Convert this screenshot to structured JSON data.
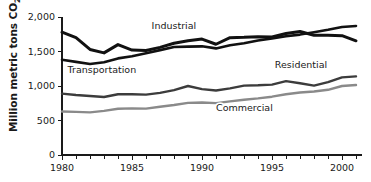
{
  "chart_data": {
    "type": "line",
    "title": "",
    "xlabel": "",
    "ylabel": "Million metric tons CO2",
    "ylabel_main": "Million metric tons CO",
    "ylabel_sub": "2",
    "xlim": [
      1980,
      2001
    ],
    "ylim": [
      0,
      2000
    ],
    "grid": false,
    "legend_position": "inline-annotations",
    "ytick_labels": [
      "2,000",
      "1,500",
      "1,000",
      "500",
      "0"
    ],
    "ytick_values": [
      2000,
      1500,
      1000,
      500,
      0
    ],
    "xtick_labels": [
      "1980",
      "1985",
      "1990",
      "1995",
      "2000"
    ],
    "xtick_values": [
      1980,
      1985,
      1990,
      1995,
      2000
    ],
    "x": [
      1980,
      1981,
      1982,
      1983,
      1984,
      1985,
      1986,
      1987,
      1988,
      1989,
      1990,
      1991,
      1992,
      1993,
      1994,
      1995,
      1996,
      1997,
      1998,
      1999,
      2000,
      2001
    ],
    "series": [
      {
        "name": "Industrial",
        "color": "#111111",
        "width": 3.0,
        "label_x": 1986.4,
        "label_y": 1830,
        "values": [
          1780,
          1700,
          1530,
          1480,
          1600,
          1520,
          1515,
          1560,
          1620,
          1655,
          1680,
          1605,
          1700,
          1705,
          1715,
          1710,
          1760,
          1790,
          1735,
          1735,
          1730,
          1655
        ]
      },
      {
        "name": "Transportation",
        "color": "#111111",
        "width": 2.6,
        "label_x": 1980.4,
        "label_y": 1195,
        "values": [
          1380,
          1350,
          1320,
          1345,
          1400,
          1430,
          1475,
          1520,
          1565,
          1570,
          1575,
          1545,
          1590,
          1620,
          1660,
          1690,
          1720,
          1745,
          1780,
          1815,
          1855,
          1870
        ]
      },
      {
        "name": "Residential",
        "color": "#3c3c3c",
        "width": 2.4,
        "label_x": 1995.2,
        "label_y": 1255,
        "values": [
          890,
          870,
          855,
          840,
          880,
          880,
          875,
          900,
          940,
          1000,
          955,
          935,
          965,
          1005,
          1010,
          1020,
          1070,
          1040,
          1005,
          1055,
          1125,
          1140
        ]
      },
      {
        "name": "Commercial",
        "color": "#8a8a8a",
        "width": 2.4,
        "label_x": 1991.0,
        "label_y": 640,
        "values": [
          630,
          625,
          618,
          640,
          670,
          675,
          672,
          700,
          725,
          755,
          760,
          752,
          778,
          800,
          820,
          845,
          880,
          905,
          920,
          945,
          1000,
          1015
        ]
      }
    ]
  }
}
